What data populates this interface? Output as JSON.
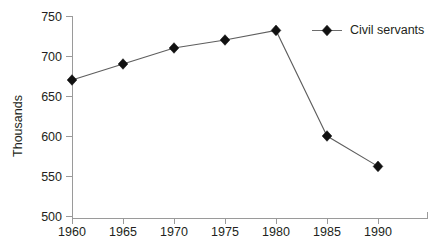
{
  "chart_data": {
    "type": "line",
    "title": "",
    "subtitle": "",
    "xlabel": "",
    "ylabel": "Thousands",
    "x": [
      1960,
      1965,
      1970,
      1975,
      1980,
      1985,
      1990
    ],
    "xtick_labels": [
      "1960",
      "1965",
      "1970",
      "1975",
      "1980",
      "1985",
      "1990"
    ],
    "ytick_labels": [
      "500",
      "550",
      "600",
      "650",
      "700",
      "750"
    ],
    "ytick_values": [
      500,
      550,
      600,
      650,
      700,
      750
    ],
    "xlim": [
      1960,
      1995
    ],
    "ylim": [
      500,
      750
    ],
    "grid": false,
    "legend_position": "top-right-inside",
    "series": [
      {
        "name": "Civil servants",
        "marker": "diamond",
        "color": "#111111",
        "line_color": "#5e5e5e",
        "values": [
          670,
          690,
          710,
          720,
          732,
          600,
          562
        ]
      }
    ],
    "annotations": []
  },
  "legend": {
    "entries": [
      {
        "label": "Civil servants",
        "marker": "diamond-marker"
      }
    ]
  },
  "axes": {
    "y_axis_title": "Thousands",
    "x_axis_title": ""
  }
}
